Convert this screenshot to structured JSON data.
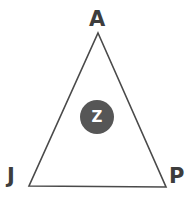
{
  "figure": {
    "type": "geometry-diagram",
    "canvas": {
      "width": 196,
      "height": 208,
      "background": "#ffffff"
    },
    "shape": {
      "name": "triangle",
      "stroke_color": "#4a4a4a",
      "stroke_width": 1.6,
      "fill": "none",
      "points": "98,33 166,187 29,186"
    },
    "vertices": [
      {
        "id": "apex",
        "label": "A",
        "x": 98,
        "y": 33
      },
      {
        "id": "bottom-left",
        "label": "J",
        "x": 29,
        "y": 186
      },
      {
        "id": "bottom-right",
        "label": "P",
        "x": 166,
        "y": 187
      }
    ],
    "interior_point": {
      "label": "Z",
      "x": 97,
      "y": 117,
      "diameter": 34,
      "fill_color": "#565656",
      "text_color": "#ffffff"
    }
  }
}
